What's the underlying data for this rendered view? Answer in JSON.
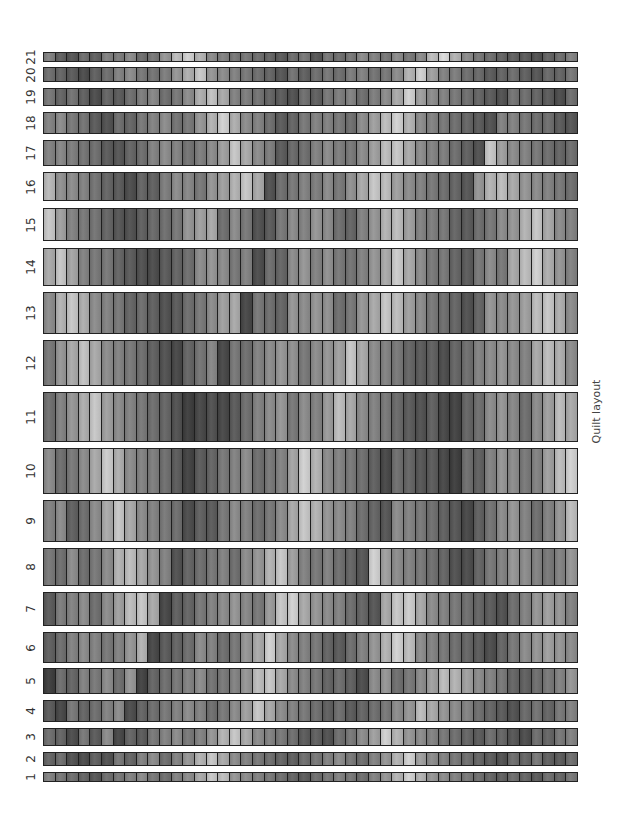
{
  "title": "Quilt layout",
  "columns": 46,
  "rows": [
    {
      "label": "21",
      "top": 52,
      "height": 10,
      "values": [
        130,
        95,
        85,
        110,
        95,
        130,
        125,
        140,
        110,
        120,
        150,
        190,
        210,
        180,
        140,
        130,
        120,
        120,
        110,
        100,
        90,
        110,
        120,
        85,
        120,
        110,
        120,
        140,
        130,
        120,
        140,
        120,
        140,
        190,
        220,
        180,
        140,
        120,
        110,
        100,
        95,
        90,
        80,
        100,
        110,
        130
      ]
    },
    {
      "label": "20",
      "top": 67,
      "height": 15,
      "values": [
        110,
        100,
        90,
        75,
        95,
        110,
        130,
        140,
        120,
        115,
        125,
        150,
        175,
        200,
        150,
        140,
        130,
        120,
        110,
        100,
        85,
        115,
        95,
        110,
        120,
        110,
        125,
        130,
        115,
        120,
        140,
        180,
        210,
        160,
        130,
        125,
        110,
        105,
        90,
        100,
        110,
        95,
        85,
        105,
        100,
        120
      ]
    },
    {
      "label": "19",
      "top": 88,
      "height": 18,
      "values": [
        120,
        100,
        115,
        95,
        75,
        100,
        90,
        110,
        125,
        135,
        110,
        120,
        140,
        175,
        195,
        170,
        130,
        125,
        115,
        100,
        90,
        80,
        110,
        95,
        120,
        125,
        130,
        110,
        125,
        140,
        170,
        210,
        160,
        140,
        130,
        120,
        110,
        100,
        90,
        80,
        115,
        110,
        100,
        90,
        75,
        110
      ]
    },
    {
      "label": "18",
      "top": 112,
      "height": 22,
      "values": [
        130,
        140,
        120,
        115,
        90,
        80,
        110,
        100,
        120,
        130,
        140,
        115,
        120,
        150,
        180,
        210,
        175,
        140,
        130,
        110,
        90,
        100,
        120,
        130,
        130,
        120,
        110,
        140,
        160,
        190,
        210,
        180,
        140,
        130,
        120,
        110,
        100,
        90,
        80,
        130,
        130,
        120,
        110,
        110,
        90,
        85
      ]
    },
    {
      "label": "17",
      "top": 140,
      "height": 26,
      "values": [
        130,
        135,
        125,
        115,
        110,
        90,
        85,
        100,
        110,
        130,
        140,
        130,
        115,
        125,
        140,
        160,
        200,
        170,
        140,
        125,
        90,
        105,
        110,
        130,
        140,
        125,
        120,
        140,
        160,
        190,
        200,
        170,
        140,
        130,
        125,
        110,
        95,
        80,
        200,
        160,
        140,
        130,
        120,
        110,
        100,
        110
      ]
    },
    {
      "label": "16",
      "top": 172,
      "height": 29,
      "values": [
        185,
        145,
        140,
        130,
        115,
        100,
        90,
        75,
        100,
        95,
        125,
        140,
        135,
        120,
        150,
        160,
        180,
        200,
        170,
        80,
        110,
        120,
        130,
        125,
        140,
        120,
        145,
        170,
        200,
        190,
        160,
        140,
        130,
        120,
        110,
        100,
        85,
        150,
        180,
        190,
        170,
        150,
        140,
        130,
        120,
        110
      ]
    },
    {
      "label": "15",
      "top": 208,
      "height": 33,
      "values": [
        200,
        160,
        130,
        120,
        115,
        100,
        85,
        80,
        95,
        105,
        110,
        120,
        150,
        160,
        170,
        110,
        140,
        120,
        80,
        90,
        120,
        140,
        130,
        150,
        140,
        110,
        100,
        130,
        150,
        180,
        190,
        160,
        130,
        125,
        120,
        100,
        90,
        110,
        120,
        140,
        150,
        180,
        200,
        170,
        140,
        130
      ]
    },
    {
      "label": "14",
      "top": 248,
      "height": 38,
      "values": [
        170,
        200,
        165,
        130,
        120,
        120,
        100,
        90,
        80,
        75,
        90,
        100,
        110,
        140,
        150,
        140,
        120,
        130,
        75,
        110,
        100,
        140,
        150,
        130,
        145,
        120,
        115,
        130,
        150,
        170,
        205,
        170,
        140,
        120,
        120,
        100,
        90,
        120,
        140,
        120,
        170,
        190,
        210,
        175,
        150,
        130
      ]
    },
    {
      "label": "13",
      "top": 292,
      "height": 42,
      "values": [
        140,
        180,
        200,
        175,
        140,
        130,
        120,
        100,
        110,
        95,
        80,
        90,
        110,
        120,
        140,
        160,
        170,
        70,
        120,
        110,
        100,
        150,
        140,
        150,
        145,
        110,
        120,
        150,
        170,
        200,
        190,
        160,
        140,
        120,
        110,
        100,
        80,
        100,
        150,
        140,
        150,
        160,
        190,
        200,
        175,
        140
      ]
    },
    {
      "label": "12",
      "top": 340,
      "height": 46,
      "values": [
        120,
        150,
        170,
        195,
        170,
        140,
        130,
        120,
        110,
        95,
        80,
        70,
        100,
        115,
        135,
        70,
        120,
        110,
        130,
        140,
        150,
        145,
        120,
        140,
        150,
        160,
        200,
        170,
        140,
        130,
        120,
        100,
        90,
        95,
        75,
        100,
        110,
        130,
        140,
        150,
        140,
        130,
        170,
        190,
        175,
        140
      ]
    },
    {
      "label": "11",
      "top": 392,
      "height": 50,
      "values": [
        110,
        130,
        150,
        175,
        200,
        160,
        140,
        130,
        120,
        110,
        100,
        80,
        60,
        70,
        80,
        70,
        90,
        110,
        130,
        140,
        150,
        120,
        140,
        130,
        155,
        190,
        170,
        140,
        130,
        120,
        105,
        90,
        80,
        95,
        70,
        65,
        100,
        110,
        140,
        150,
        135,
        110,
        140,
        160,
        190,
        170
      ]
    },
    {
      "label": "10",
      "top": 448,
      "height": 46,
      "values": [
        140,
        110,
        120,
        140,
        170,
        205,
        175,
        140,
        130,
        125,
        110,
        90,
        65,
        90,
        100,
        120,
        130,
        140,
        110,
        120,
        130,
        165,
        210,
        180,
        140,
        130,
        120,
        110,
        95,
        70,
        110,
        100,
        85,
        90,
        70,
        60,
        110,
        95,
        130,
        150,
        140,
        120,
        130,
        160,
        190,
        210
      ]
    },
    {
      "label": "9",
      "top": 500,
      "height": 42,
      "values": [
        130,
        140,
        95,
        110,
        140,
        170,
        200,
        170,
        140,
        130,
        120,
        110,
        75,
        95,
        90,
        120,
        140,
        130,
        110,
        120,
        140,
        170,
        200,
        180,
        150,
        140,
        130,
        110,
        100,
        85,
        140,
        130,
        120,
        110,
        95,
        85,
        70,
        95,
        115,
        140,
        150,
        130,
        110,
        130,
        150,
        190
      ]
    },
    {
      "label": "8",
      "top": 548,
      "height": 38,
      "values": [
        120,
        110,
        140,
        110,
        120,
        140,
        180,
        190,
        170,
        150,
        130,
        80,
        100,
        110,
        120,
        130,
        110,
        140,
        150,
        180,
        200,
        160,
        130,
        120,
        130,
        110,
        100,
        85,
        210,
        160,
        140,
        130,
        120,
        110,
        100,
        80,
        75,
        100,
        120,
        130,
        150,
        140,
        130,
        120,
        130,
        150
      ]
    },
    {
      "label": "7",
      "top": 592,
      "height": 34,
      "values": [
        90,
        125,
        130,
        140,
        110,
        140,
        160,
        190,
        200,
        170,
        70,
        95,
        100,
        120,
        130,
        140,
        150,
        135,
        120,
        155,
        200,
        210,
        170,
        150,
        140,
        130,
        110,
        100,
        85,
        170,
        200,
        205,
        170,
        140,
        130,
        120,
        110,
        100,
        90,
        80,
        110,
        130,
        150,
        160,
        150,
        130
      ]
    },
    {
      "label": "6",
      "top": 632,
      "height": 31,
      "values": [
        95,
        110,
        130,
        140,
        130,
        120,
        130,
        150,
        180,
        70,
        90,
        100,
        110,
        140,
        130,
        110,
        120,
        150,
        170,
        210,
        170,
        140,
        130,
        120,
        100,
        90,
        110,
        130,
        150,
        180,
        210,
        190,
        140,
        130,
        120,
        110,
        100,
        90,
        75,
        100,
        120,
        140,
        150,
        160,
        150,
        140
      ]
    },
    {
      "label": "5",
      "top": 668,
      "height": 26,
      "values": [
        60,
        110,
        100,
        130,
        120,
        140,
        110,
        150,
        65,
        100,
        110,
        120,
        130,
        140,
        115,
        120,
        130,
        150,
        190,
        200,
        170,
        140,
        130,
        120,
        100,
        110,
        95,
        75,
        140,
        150,
        110,
        120,
        140,
        160,
        190,
        180,
        160,
        140,
        130,
        120,
        100,
        95,
        110,
        120,
        130,
        150
      ]
    },
    {
      "label": "4",
      "top": 700,
      "height": 22,
      "values": [
        90,
        70,
        120,
        100,
        110,
        130,
        140,
        75,
        100,
        110,
        120,
        130,
        140,
        130,
        110,
        120,
        140,
        160,
        200,
        170,
        140,
        130,
        120,
        110,
        95,
        110,
        90,
        100,
        110,
        120,
        140,
        150,
        190,
        170,
        150,
        140,
        130,
        110,
        100,
        90,
        80,
        105,
        115,
        100,
        120,
        130
      ]
    },
    {
      "label": "3",
      "top": 728,
      "height": 18,
      "values": [
        110,
        100,
        75,
        120,
        90,
        140,
        70,
        100,
        90,
        120,
        130,
        140,
        120,
        130,
        150,
        180,
        200,
        170,
        140,
        130,
        120,
        110,
        90,
        95,
        80,
        110,
        120,
        140,
        160,
        210,
        180,
        150,
        140,
        130,
        120,
        110,
        100,
        90,
        110,
        100,
        85,
        75,
        110,
        100,
        120,
        130
      ]
    },
    {
      "label": "2",
      "top": 752,
      "height": 14,
      "values": [
        100,
        110,
        80,
        75,
        95,
        80,
        120,
        100,
        130,
        140,
        110,
        130,
        150,
        180,
        200,
        170,
        140,
        130,
        120,
        110,
        100,
        95,
        110,
        120,
        130,
        140,
        120,
        110,
        130,
        150,
        180,
        210,
        160,
        140,
        130,
        120,
        110,
        100,
        90,
        80,
        110,
        100,
        120,
        95,
        90,
        110
      ]
    },
    {
      "label": "1",
      "top": 772,
      "height": 10,
      "values": [
        130,
        120,
        110,
        100,
        85,
        110,
        120,
        130,
        140,
        120,
        110,
        130,
        140,
        170,
        200,
        190,
        150,
        140,
        130,
        120,
        110,
        100,
        90,
        110,
        120,
        130,
        120,
        110,
        130,
        150,
        180,
        210,
        180,
        150,
        140,
        130,
        120,
        110,
        100,
        95,
        110,
        100,
        90,
        110,
        100,
        120
      ]
    }
  ]
}
